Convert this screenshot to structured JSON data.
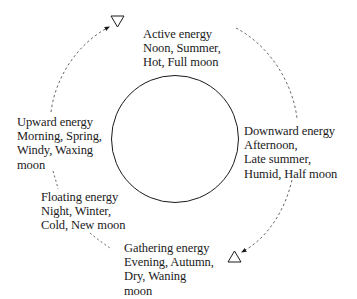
{
  "diagram": {
    "type": "cycle",
    "center_shape": "circle",
    "stages": [
      {
        "id": "active",
        "title": "Active energy",
        "lines": [
          "Active energy",
          "Noon, Summer,",
          "Hot, Full moon"
        ]
      },
      {
        "id": "downward",
        "title": "Downward energy",
        "lines": [
          "Downward energy",
          "Afternoon,",
          "Late summer,",
          "Humid, Half moon"
        ]
      },
      {
        "id": "gathering",
        "title": "Gathering energy",
        "lines": [
          "Gathering energy",
          "Evening, Autumn,",
          "Dry, Waning",
          "moon"
        ]
      },
      {
        "id": "floating",
        "title": "Floating energy",
        "lines": [
          "Floating energy",
          "Night, Winter,",
          "Cold, New moon"
        ]
      },
      {
        "id": "upward",
        "title": "Upward energy",
        "lines": [
          "Upward energy",
          "Morning, Spring,",
          "Windy, Waxing",
          "moon"
        ]
      }
    ],
    "markers": [
      {
        "name": "triangle-down-icon",
        "glyph": "▽",
        "position": "top, between Upward and Active"
      },
      {
        "name": "triangle-up-icon",
        "glyph": "△",
        "position": "bottom-right, between Downward and Gathering"
      }
    ],
    "connector_style": "dashed-arrow",
    "colors": {
      "ink": "#1a1a1a",
      "dash": "#555555",
      "background": "#ffffff"
    }
  }
}
